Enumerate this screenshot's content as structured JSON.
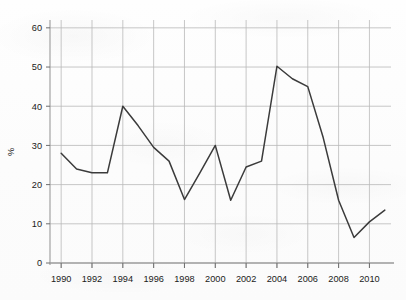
{
  "chart_data": {
    "type": "line",
    "title": "",
    "subtitle": "",
    "xlabel": "",
    "ylabel": "%",
    "xlim": [
      1989.6,
      2011.4
    ],
    "ylim": [
      0,
      62
    ],
    "grid": true,
    "legend": false,
    "legend_position": "none",
    "line_color": "#3b3b3b",
    "grid_color": "#b9b9b9",
    "axis_color": "#9a9a9a",
    "x_tick_labels": [
      "1990",
      "1992",
      "1994",
      "1996",
      "1998",
      "2000",
      "2002",
      "2004",
      "2006",
      "2008",
      "2010"
    ],
    "x_ticks": [
      1990,
      1992,
      1994,
      1996,
      1998,
      2000,
      2002,
      2004,
      2006,
      2008,
      2010
    ],
    "y_tick_labels": [
      "0",
      "10",
      "20",
      "30",
      "40",
      "50",
      "60"
    ],
    "y_ticks": [
      0,
      10,
      20,
      30,
      40,
      50,
      60
    ],
    "x": [
      1990,
      1991,
      1992,
      1993,
      1994,
      1995,
      1996,
      1997,
      1998,
      1999,
      2000,
      2001,
      2002,
      2003,
      2004,
      2005,
      2006,
      2007,
      2008,
      2009,
      2010,
      2011
    ],
    "values": [
      28,
      24,
      23,
      23,
      40,
      35,
      29.5,
      26,
      16.2,
      23,
      30,
      16,
      24.5,
      26,
      50.2,
      47,
      45,
      32,
      16,
      6.5,
      10.5,
      13.5
    ],
    "series": [
      {
        "name": "%",
        "values": [
          28,
          24,
          23,
          23,
          40,
          35,
          29.5,
          26,
          16.2,
          23,
          30,
          16,
          24.5,
          26,
          50.2,
          47,
          45,
          32,
          16,
          6.5,
          10.5,
          13.5
        ]
      }
    ]
  }
}
